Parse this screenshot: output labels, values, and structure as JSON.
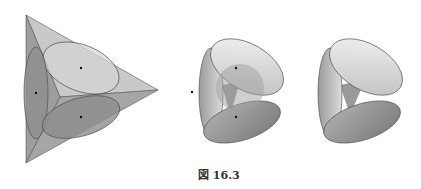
{
  "figure": {
    "caption": "図 16.3",
    "panels": [
      {
        "name": "tetrahedron-with-inscribed-ellipses",
        "points": 3
      },
      {
        "name": "cone-surfaces-with-inner-sphere",
        "points": 3
      },
      {
        "name": "cone-surfaces",
        "points": 0
      }
    ]
  },
  "colors": {
    "light_face": "#c8c8c8",
    "mid_face": "#a4a4a4",
    "dark_face": "#8e8e8e",
    "edge": "#555555"
  }
}
